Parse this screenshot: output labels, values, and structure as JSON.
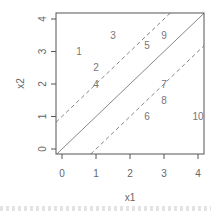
{
  "chart_data": {
    "type": "scatter",
    "title": "",
    "xlabel": "x1",
    "ylabel": "x2",
    "xlim": [
      -0.2,
      4.2
    ],
    "ylim": [
      -0.15,
      4.15
    ],
    "xticks": [
      0,
      1,
      2,
      3,
      4
    ],
    "yticks": [
      0,
      1,
      2,
      3,
      4
    ],
    "xtick_labels": [
      "0",
      "1",
      "2",
      "3",
      "4"
    ],
    "ytick_labels": [
      "0",
      "1",
      "2",
      "3",
      "4"
    ],
    "grid": false,
    "legend": "none",
    "points": [
      {
        "label": "1",
        "x": 0.5,
        "y": 3.0
      },
      {
        "label": "2",
        "x": 1.0,
        "y": 2.5
      },
      {
        "label": "3",
        "x": 1.5,
        "y": 3.5
      },
      {
        "label": "4",
        "x": 1.0,
        "y": 2.0
      },
      {
        "label": "5",
        "x": 2.5,
        "y": 3.2
      },
      {
        "label": "6",
        "x": 2.5,
        "y": 1.0
      },
      {
        "label": "7",
        "x": 3.0,
        "y": 2.0
      },
      {
        "label": "8",
        "x": 3.0,
        "y": 1.5
      },
      {
        "label": "9",
        "x": 3.0,
        "y": 3.5
      },
      {
        "label": "10",
        "x": 4.0,
        "y": 1.0
      }
    ],
    "lines": [
      {
        "name": "y = x",
        "intercept": 0,
        "slope": 1,
        "style": "solid"
      },
      {
        "name": "y = x + 1",
        "intercept": 1,
        "slope": 1,
        "style": "dashed"
      },
      {
        "name": "y = x - 1",
        "intercept": -1,
        "slope": 1,
        "style": "dashed"
      }
    ],
    "colors": {
      "axis": "#555555",
      "text": "#666666",
      "points": "#777777",
      "lines": "#888888"
    }
  }
}
